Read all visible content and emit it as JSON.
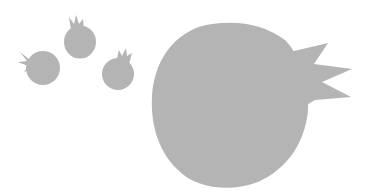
{
  "scene": {
    "description": "Gray silhouette illustration of pomegranates",
    "background": "#ffffff",
    "fill": "#b4b4b4",
    "objects": [
      {
        "name": "small-pomegranate-left",
        "cx": 43,
        "cy": 68,
        "r": 17
      },
      {
        "name": "small-pomegranate-top",
        "cx": 80,
        "cy": 41,
        "r": 16
      },
      {
        "name": "small-pomegranate-right",
        "cx": 118,
        "cy": 73,
        "r": 16
      },
      {
        "name": "large-pomegranate",
        "cx": 232,
        "cy": 108,
        "r": 80
      }
    ]
  }
}
